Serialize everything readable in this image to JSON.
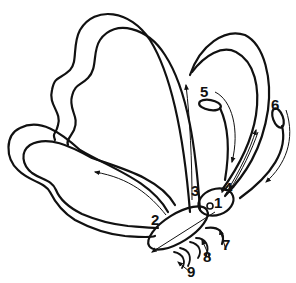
{
  "diagram": {
    "labels": [
      {
        "id": "1",
        "text": "1"
      },
      {
        "id": "2",
        "text": "2"
      },
      {
        "id": "3",
        "text": "3"
      },
      {
        "id": "4",
        "text": "4"
      },
      {
        "id": "5",
        "text": "5"
      },
      {
        "id": "6",
        "text": "6"
      },
      {
        "id": "7",
        "text": "7"
      },
      {
        "id": "8",
        "text": "8"
      },
      {
        "id": "9",
        "text": "9"
      }
    ],
    "colors": {
      "line": "#111111",
      "background": "#ffffff"
    }
  }
}
